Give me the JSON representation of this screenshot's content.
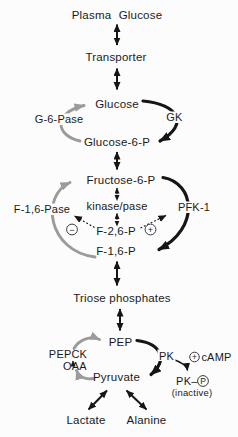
{
  "pathway": {
    "plasma_glucose": "Plasma Glucose",
    "transporter": "Transporter",
    "glucose": "Glucose",
    "glucose_6_p": "Glucose-6-P",
    "fructose_6_p": "Fructose-6-P",
    "f_2_6_p": "F-2,6-P",
    "f_1_6_p": "F-1,6-P",
    "triose_phosphates": "Triose phosphates",
    "pep": "PEP",
    "oaa": "OAA",
    "pyruvate": "Pyruvate",
    "lactate": "Lactate",
    "alanine": "Alanine"
  },
  "enzymes": {
    "g_6_pase": "G-6-Pase",
    "gk": "GK",
    "f_1_6_pase": "F-1,6-Pase",
    "kinase_pase": "kinase/pase",
    "pfk_1": "PFK-1",
    "pepck": "PEPCK",
    "pk": "PK",
    "pk_p": "PK–",
    "pk_p_phospho": "P",
    "pk_p_state": "(inactive)"
  },
  "signals": {
    "camp": "cAMP",
    "camp_sign": "+",
    "pfk_activation_sign": "+",
    "f16pase_inhibition_sign": "−"
  },
  "colors": {
    "forward": "#161616",
    "reverse": "#9b9b9b",
    "text": "#1a1a1a",
    "background": "#fcfcfc"
  }
}
